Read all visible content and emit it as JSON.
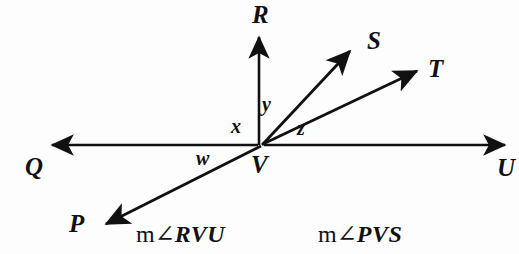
{
  "figure": {
    "kind": "geometry-diagram",
    "width": 519,
    "height": 254,
    "background_color": "#fdfdfd",
    "stroke_color": "#111111",
    "vertex": {
      "label": "V",
      "x": 262,
      "y": 145
    },
    "points": [
      {
        "name": "R",
        "label": "R",
        "x": 259,
        "y": 14,
        "ray_tip_x": 259,
        "ray_tip_y": 30,
        "direction": "up"
      },
      {
        "name": "S",
        "label": "S",
        "x": 372,
        "y": 41,
        "ray_tip_x": 356,
        "ray_tip_y": 45,
        "direction": "upper-right-steep"
      },
      {
        "name": "T",
        "label": "T",
        "x": 433,
        "y": 69,
        "ray_tip_x": 424,
        "ray_tip_y": 67,
        "direction": "upper-right-shallow"
      },
      {
        "name": "U",
        "label": "U",
        "x": 502,
        "y": 168,
        "ray_tip_x": 514,
        "ray_tip_y": 145,
        "direction": "right"
      },
      {
        "name": "Q",
        "label": "Q",
        "x": 30,
        "y": 167,
        "ray_tip_x": 43,
        "ray_tip_y": 145,
        "direction": "left"
      },
      {
        "name": "P",
        "label": "P",
        "x": 73,
        "y": 224,
        "ray_tip_x": 97,
        "ray_tip_y": 228,
        "direction": "lower-left"
      }
    ],
    "angle_labels": [
      {
        "name": "x",
        "label": "x",
        "x": 234,
        "y": 122,
        "between": "ray-Q and ray-R"
      },
      {
        "name": "y",
        "label": "y",
        "x": 264,
        "y": 100,
        "between": "ray-R and ray-S"
      },
      {
        "name": "z",
        "label": "z",
        "x": 299,
        "y": 124,
        "between": "ray-T and ray-U"
      },
      {
        "name": "w",
        "label": "w",
        "x": 199,
        "y": 152,
        "between": "ray-P and ray-Q"
      }
    ],
    "vertex_label_pos": {
      "x": 252,
      "y": 155
    },
    "expressions": [
      {
        "name": "m-angle-RVU",
        "prefix": "m",
        "symbol": "∠",
        "points": "RVU",
        "full_text": "m∠RVU",
        "x": 136,
        "y": 222
      },
      {
        "name": "m-angle-PVS",
        "prefix": "m",
        "symbol": "∠",
        "points": "PVS",
        "full_text": "m∠PVS",
        "x": 318,
        "y": 222
      }
    ],
    "rays": [
      {
        "name": "ray-QU-line",
        "from": "Q",
        "through": "V",
        "to": "U",
        "kind": "line-double-arrow"
      },
      {
        "name": "ray-VR",
        "from": "V",
        "to": "R",
        "kind": "ray-arrow"
      },
      {
        "name": "ray-VS",
        "from": "V",
        "to": "S",
        "kind": "ray-arrow"
      },
      {
        "name": "ray-PT-line",
        "from": "P",
        "through": "V",
        "to": "T",
        "kind": "line-double-arrow"
      }
    ]
  }
}
